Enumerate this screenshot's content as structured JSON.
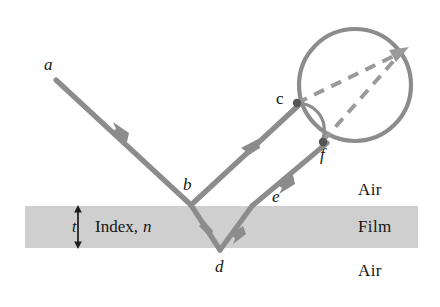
{
  "figure": {
    "colors": {
      "ray": "#8c8c8c",
      "film_fill": "#cfcfcf",
      "text": "#151515",
      "background": "#ffffff",
      "dashed": "#9a9a9a"
    },
    "film": {
      "thickness_label": "t",
      "index_label_static": "Index,",
      "index_label_symbol": "n"
    },
    "media": {
      "above": "Air",
      "inside": "Film",
      "below": "Air"
    },
    "points": {
      "a": "a",
      "b": "b",
      "c": "c",
      "d": "d",
      "e": "e",
      "f": "f"
    }
  }
}
